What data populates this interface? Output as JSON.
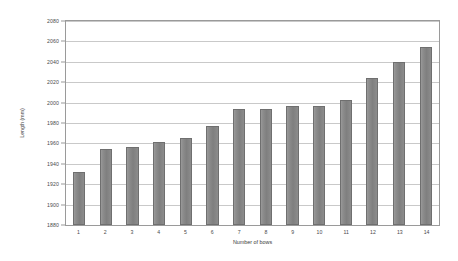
{
  "chart_data": {
    "type": "bar",
    "title": "",
    "xlabel": "Number of bows",
    "ylabel": "Length (mm)",
    "categories": [
      "1",
      "2",
      "3",
      "4",
      "5",
      "6",
      "7",
      "8",
      "9",
      "10",
      "11",
      "12",
      "13",
      "14"
    ],
    "values": [
      1932,
      1955,
      1956,
      1961,
      1965,
      1977,
      1994,
      1994,
      1997,
      1997,
      2003,
      2024,
      2040,
      2055
    ],
    "ylim": [
      1880,
      2080
    ],
    "ytick_step": 20,
    "yticks": [
      1880,
      1900,
      1920,
      1940,
      1960,
      1980,
      2000,
      2020,
      2040,
      2060,
      2080
    ],
    "grid": true,
    "legend": false,
    "bar_color": "#8a8a8a",
    "bar_border_color": "#6f6f6f",
    "gridline_color": "#c9c9c9",
    "axis_color": "#9a9a9a",
    "background": "#ffffff"
  }
}
